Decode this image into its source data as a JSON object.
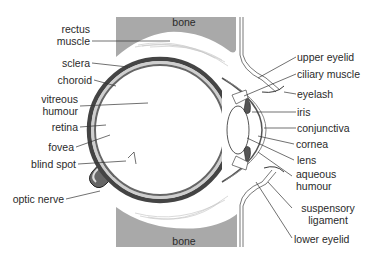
{
  "diagram": {
    "colors": {
      "bone": "#a9a9a9",
      "sclera_outer": "#555555",
      "choroid": "#bdbdbd",
      "retina": "#777777",
      "optic_nerve": "#666666",
      "line": "#333333",
      "text": "#2a2a2a"
    },
    "bone_labels": {
      "top": "bone",
      "bottom": "bone"
    },
    "left_labels": [
      {
        "id": "rectus-muscle",
        "line1": "rectus",
        "line2": "muscle"
      },
      {
        "id": "sclera",
        "line1": "sclera"
      },
      {
        "id": "choroid",
        "line1": "choroid"
      },
      {
        "id": "vitreous-humour",
        "line1": "vitreous",
        "line2": "humour"
      },
      {
        "id": "retina",
        "line1": "retina"
      },
      {
        "id": "fovea",
        "line1": "fovea"
      },
      {
        "id": "blind-spot",
        "line1": "blind spot"
      },
      {
        "id": "optic-nerve",
        "line1": "optic nerve"
      }
    ],
    "right_labels": [
      {
        "id": "upper-eyelid",
        "line1": "upper eyelid"
      },
      {
        "id": "ciliary-muscle",
        "line1": "ciliary muscle"
      },
      {
        "id": "eyelash",
        "line1": "eyelash"
      },
      {
        "id": "iris",
        "line1": "iris"
      },
      {
        "id": "conjunctiva",
        "line1": "conjunctiva"
      },
      {
        "id": "cornea",
        "line1": "cornea"
      },
      {
        "id": "lens",
        "line1": "lens"
      },
      {
        "id": "aqueous-humour",
        "line1": "aqueous",
        "line2": "humour"
      },
      {
        "id": "suspensory-ligament",
        "line1": "suspensory",
        "line2": "ligament"
      },
      {
        "id": "lower-eyelid",
        "line1": "lower eyelid"
      }
    ]
  }
}
